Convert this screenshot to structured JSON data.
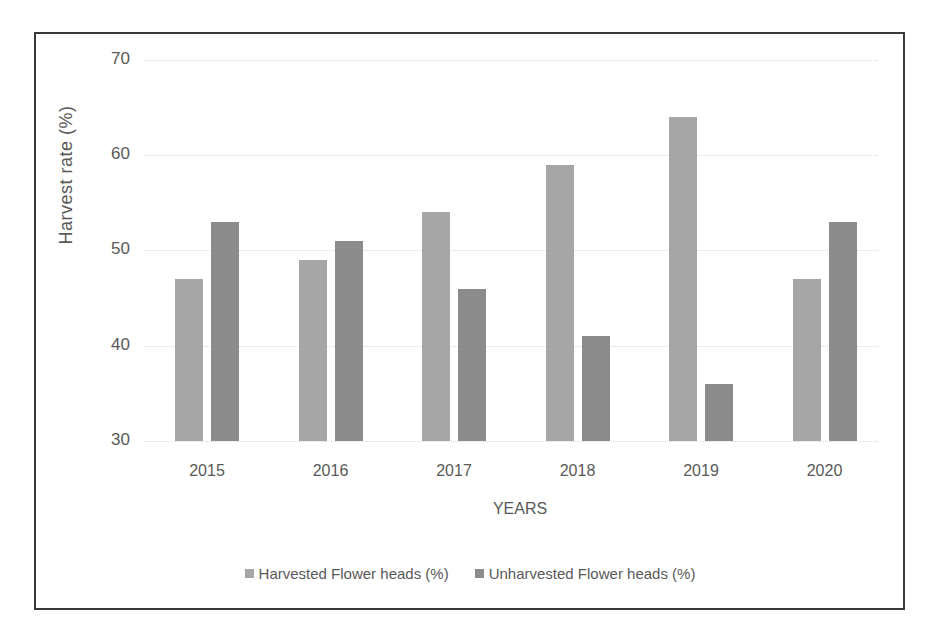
{
  "chart_data": {
    "type": "bar",
    "title": "",
    "xlabel": "YEARS",
    "ylabel": "Harvest  rate (%)",
    "ylim": [
      30,
      70
    ],
    "yticks": [
      30,
      40,
      50,
      60,
      70
    ],
    "grid": true,
    "legend_position": "bottom",
    "categories": [
      "2015",
      "2016",
      "2017",
      "2018",
      "2019",
      "2020"
    ],
    "series": [
      {
        "name": "Harvested Flower heads (%)",
        "color": "#a6a6a6",
        "values": [
          47,
          49,
          54,
          59,
          64,
          47
        ]
      },
      {
        "name": "Unharvested Flower heads (%)",
        "color": "#8c8c8c",
        "values": [
          53,
          51,
          46,
          41,
          36,
          53
        ]
      }
    ]
  }
}
